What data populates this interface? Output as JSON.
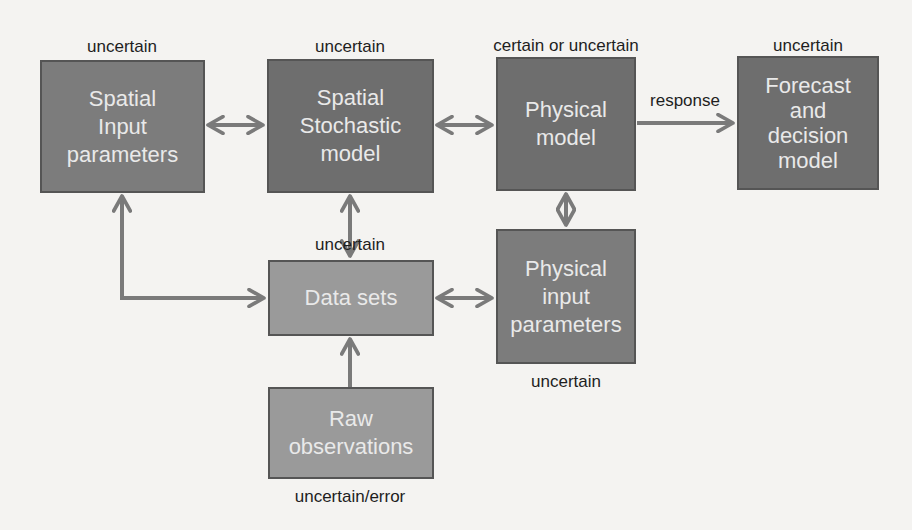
{
  "diagram": {
    "nodes": [
      {
        "id": "spatial-input-parameters",
        "text": "Spatial\nInput\nparameters",
        "annotation": "uncertain"
      },
      {
        "id": "spatial-stochastic-model",
        "text": "Spatial\nStochastic\nmodel",
        "annotation": "uncertain"
      },
      {
        "id": "physical-model",
        "text": "Physical\nmodel",
        "annotation": "certain or uncertain"
      },
      {
        "id": "forecast-decision-model",
        "text": "Forecast\nand\ndecision\nmodel",
        "annotation": "uncertain"
      },
      {
        "id": "data-sets",
        "text": "Data sets",
        "annotation": "uncertain"
      },
      {
        "id": "physical-input-parameters",
        "text": "Physical\ninput\nparameters",
        "annotation": "uncertain"
      },
      {
        "id": "raw-observations",
        "text": "Raw\nobservations",
        "annotation": "uncertain/error"
      }
    ],
    "edges": [
      {
        "from": "spatial-input-parameters",
        "to": "spatial-stochastic-model",
        "direction": "both",
        "label": ""
      },
      {
        "from": "spatial-stochastic-model",
        "to": "physical-model",
        "direction": "both",
        "label": ""
      },
      {
        "from": "physical-model",
        "to": "forecast-decision-model",
        "direction": "forward",
        "label": "response"
      },
      {
        "from": "spatial-stochastic-model",
        "to": "data-sets",
        "direction": "both",
        "label": ""
      },
      {
        "from": "physical-model",
        "to": "physical-input-parameters",
        "direction": "both",
        "label": ""
      },
      {
        "from": "data-sets",
        "to": "physical-input-parameters",
        "direction": "both",
        "label": ""
      },
      {
        "from": "data-sets",
        "to": "spatial-input-parameters",
        "direction": "both",
        "label": ""
      },
      {
        "from": "raw-observations",
        "to": "data-sets",
        "direction": "forward",
        "label": ""
      }
    ]
  },
  "colors": {
    "box_dark": "#6e6e6e",
    "box_light": "#9a9a9a",
    "arrow": "#7a7a7a",
    "background": "#f4f3f1",
    "label_text": "#1e1e1e",
    "box_text": "#e9e9e9"
  }
}
